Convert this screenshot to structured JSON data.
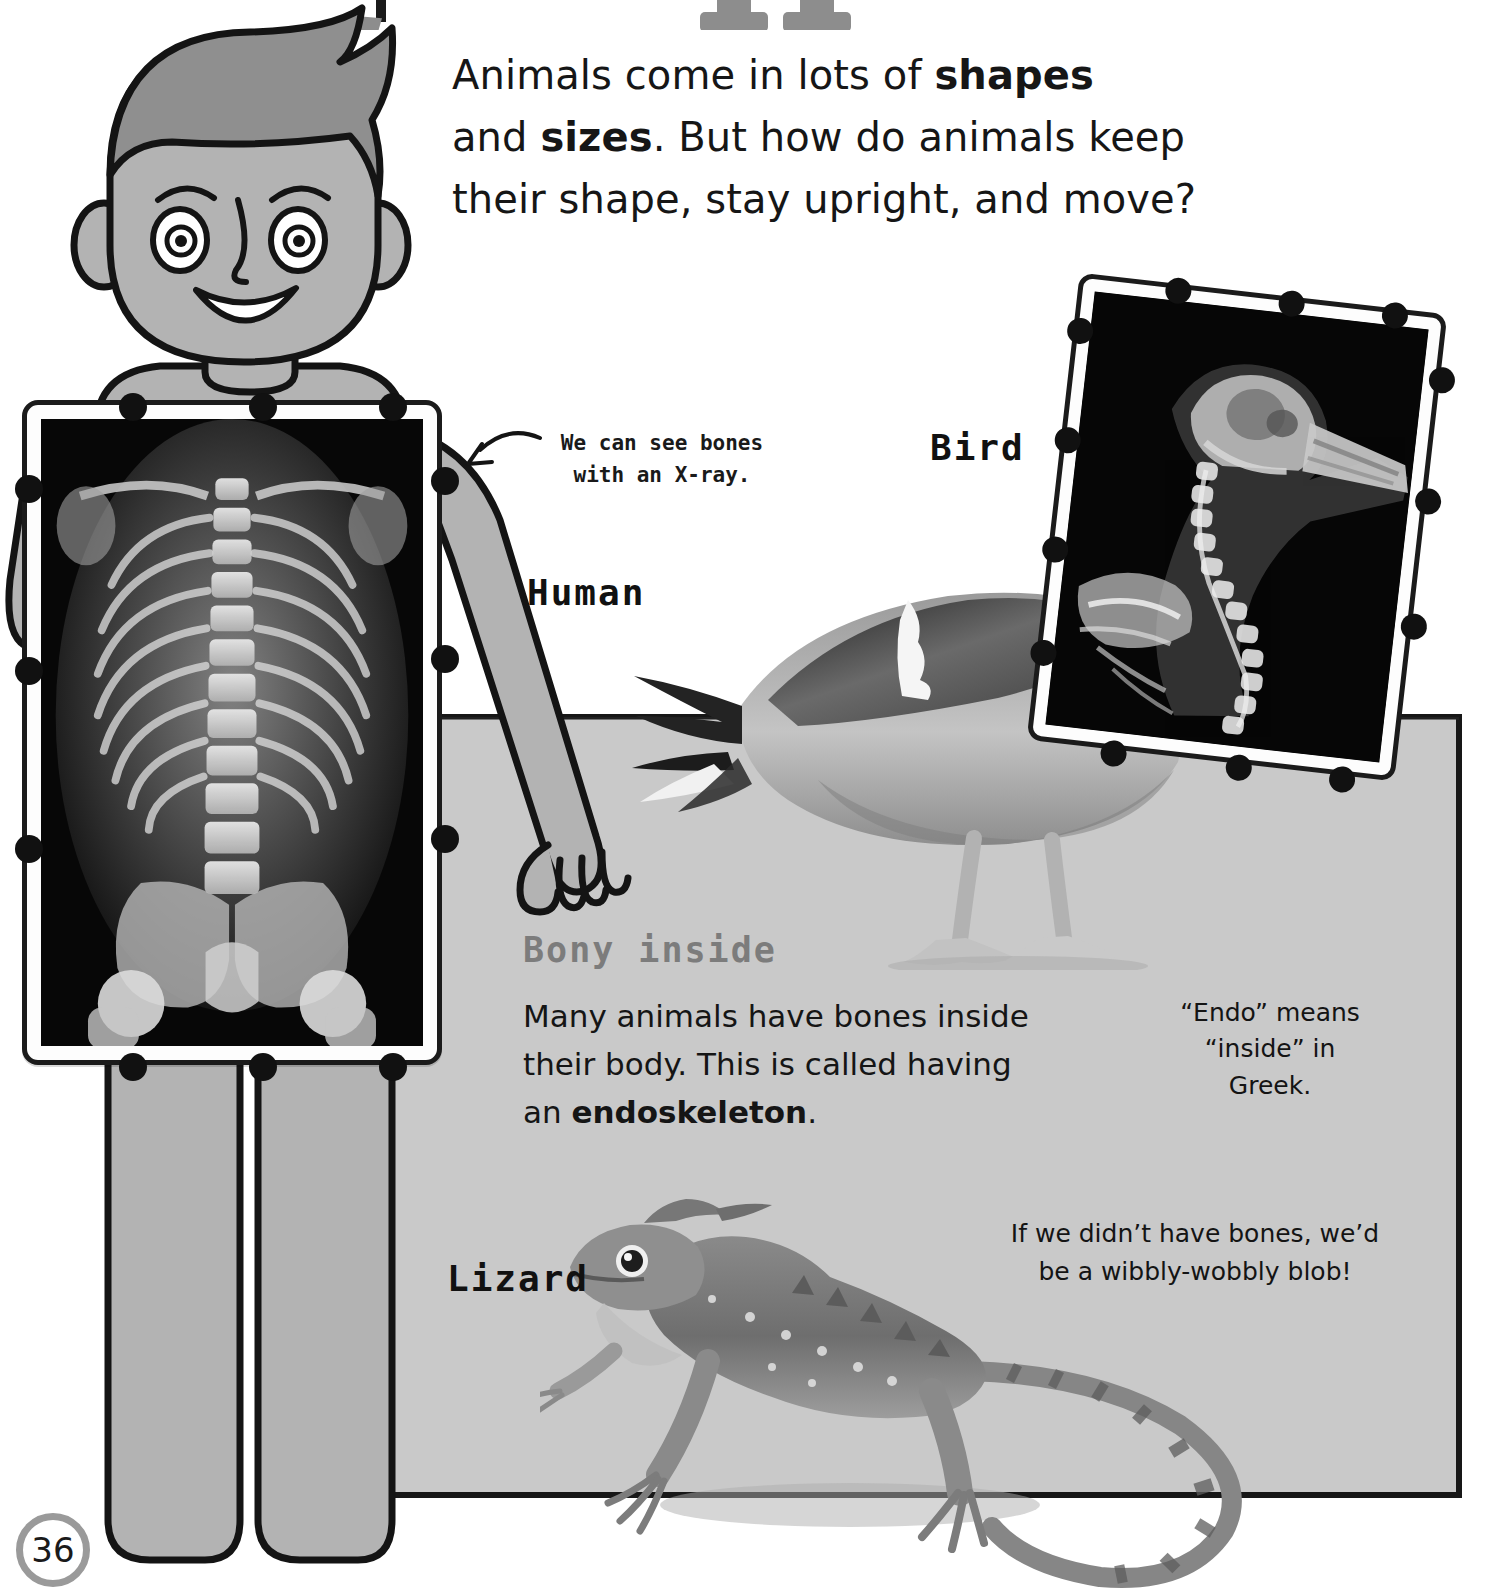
{
  "page": {
    "number": "36",
    "title_fragment": "(cut-off chapter title glyphs)"
  },
  "intro": {
    "line1_a": "Animals come in lots of ",
    "line1_b": "shapes",
    "line2_a": "and ",
    "line2_b": "sizes",
    "line2_c": ". But how do animals keep",
    "line3": "their shape, stay upright, and move?"
  },
  "labels": {
    "human": "Human",
    "bird": "Bird",
    "lizard": "Lizard"
  },
  "callouts": {
    "xray_note_line1": "We can see bones",
    "xray_note_line2": "with an X-ray.",
    "endo_line1": "“Endo” means",
    "endo_line2": "“inside” in",
    "endo_line3": "Greek.",
    "blob_line1": "If we didn’t have bones, we’d",
    "blob_line2": "be a wibbly-wobbly blob!"
  },
  "bony_section": {
    "heading": "Bony inside",
    "body_a": "Many animals have bones inside their body. This is called having an ",
    "body_b": "endoskeleton",
    "body_c": "."
  },
  "colors": {
    "panel_grey": "#c9c9c9",
    "ink": "#171717",
    "heading_grey": "#7c7c7c",
    "skin_grey": "#a9a9a9",
    "hair_grey": "#8f8f8f",
    "page_badge_ring": "#9a9a9a"
  },
  "icons": {
    "arrow": "curved-arrow-icon",
    "clips": "frame-clip-icon"
  }
}
